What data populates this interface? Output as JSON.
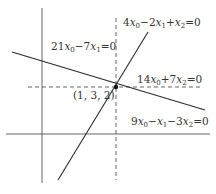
{
  "diagram": {
    "colors": {
      "line": "#2b2b2b",
      "dashed": "#555555",
      "text": "#333333",
      "point": "#111111"
    },
    "axes": {
      "vertical": {
        "x": 42,
        "y1": 8,
        "y2": 183
      },
      "horizontal": {
        "y": 134,
        "x1": 6,
        "x2": 210
      }
    },
    "dashed_lines": {
      "vertical": {
        "x": 116,
        "y1": 18,
        "y2": 180,
        "equation": "21x0−7x1=0"
      },
      "horizontal": {
        "y": 87,
        "x1": 28,
        "x2": 200,
        "equation": "14x0+7x2=0"
      }
    },
    "solid_lines": [
      {
        "id": "line-a",
        "equation": "9x0−x1−3x2=0",
        "x1": 12,
        "y1": 52,
        "x2": 205,
        "y2": 110
      },
      {
        "id": "line-b",
        "equation": "4x0−2x1+x2=0",
        "x1": 148,
        "y1": 32,
        "x2": 58,
        "y2": 180
      }
    ],
    "point": {
      "x": 116,
      "y": 87,
      "label": "(1, 3, 2)"
    },
    "labels": {
      "line_b": {
        "coef0": "4",
        "op1": "−",
        "coef1": "2",
        "op2": "+",
        "coef2": "",
        "rhs": "=0"
      },
      "dashed_v": {
        "coef0": "21",
        "op1": "−",
        "coef1": "7",
        "rhs": "=0"
      },
      "dashed_h": {
        "coef0": "14",
        "op1": "+",
        "coef2": "7",
        "rhs": "=0"
      },
      "line_a": {
        "coef0": "9",
        "op1": "−",
        "coef1": "",
        "op2": "−",
        "coef2": "3",
        "rhs": "=0"
      },
      "point": "(1, 3, 2)"
    }
  }
}
